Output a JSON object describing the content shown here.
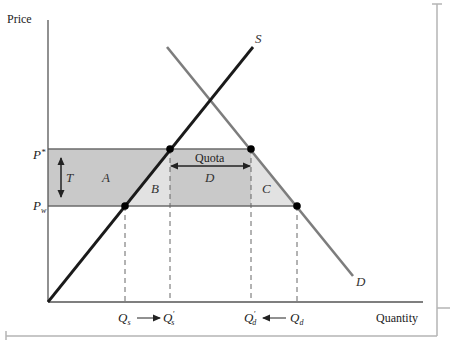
{
  "figure": {
    "axes": {
      "y_label": "Price",
      "x_label": "Quantity"
    },
    "price_levels": [
      {
        "id": "p_star",
        "label": "P*",
        "main": "P",
        "sup": "*"
      },
      {
        "id": "p_w",
        "label": "Pw",
        "main": "P",
        "sub": "w"
      }
    ],
    "curves": [
      {
        "id": "supply",
        "label": "S"
      },
      {
        "id": "demand",
        "label": "D"
      }
    ],
    "regions": [
      {
        "id": "A",
        "label": "A",
        "shade": "dark"
      },
      {
        "id": "B",
        "label": "B",
        "shade": "light"
      },
      {
        "id": "C",
        "label": "C",
        "shade": "light"
      },
      {
        "id": "D",
        "label": "D",
        "shade": "dark"
      }
    ],
    "annotations": {
      "tariff": "T",
      "quota": "Quota"
    },
    "quantity_markers": [
      {
        "id": "qs",
        "main": "Q",
        "sub": "s",
        "prime": false
      },
      {
        "id": "qs_prime",
        "main": "Q",
        "sub": "s",
        "prime": true
      },
      {
        "id": "qd_prime",
        "main": "Q",
        "sub": "d",
        "prime": true
      },
      {
        "id": "qd",
        "main": "Q",
        "sub": "d",
        "prime": false
      }
    ],
    "colors": {
      "dark_shade": "#c9c9c9",
      "light_shade": "#e2e2e2",
      "supply_line": "#1a1a1a",
      "demand_line": "#7d7d7d",
      "axis": "#555555",
      "frame": "#b5b5b5"
    }
  }
}
